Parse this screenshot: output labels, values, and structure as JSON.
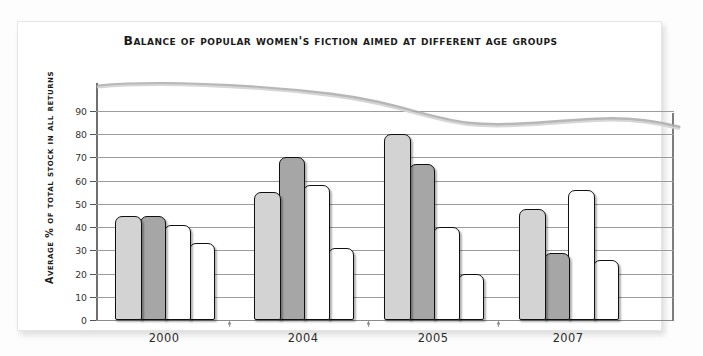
{
  "chart_data": {
    "type": "bar",
    "title": "Balance of popular women's fiction aimed at different age groups",
    "xlabel": "",
    "ylabel": "Average % of total stock in all returns",
    "ylim": [
      0,
      95
    ],
    "yticks": [
      0,
      10,
      20,
      30,
      40,
      50,
      60,
      70,
      80,
      90
    ],
    "ytick_labels": [
      "0",
      "10",
      "20",
      "30",
      "40",
      "50",
      "60",
      "70",
      "80",
      "90"
    ],
    "grid": true,
    "legend": "none",
    "categories": [
      "2000",
      "2004",
      "2005",
      "2007"
    ],
    "series": [
      {
        "name": "series-1",
        "color": "#d3d3d3",
        "values": [
          45,
          55,
          80,
          48
        ]
      },
      {
        "name": "series-2",
        "color": "#a6a6a6",
        "values": [
          45,
          70,
          67,
          29
        ]
      },
      {
        "name": "series-3",
        "color": "#ffffff",
        "values": [
          41,
          58,
          40,
          56
        ]
      },
      {
        "name": "series-4",
        "color": "#ffffff",
        "values": [
          33,
          31,
          20,
          26
        ]
      }
    ],
    "bars": [
      {
        "group": "2000",
        "series": "series-1",
        "value": 45,
        "fill": "light"
      },
      {
        "group": "2000",
        "series": "series-2",
        "value": 45,
        "fill": "medium"
      },
      {
        "group": "2000",
        "series": "series-3",
        "value": 41,
        "fill": "white"
      },
      {
        "group": "2000",
        "series": "series-4",
        "value": 33,
        "fill": "white"
      },
      {
        "group": "2004",
        "series": "series-1",
        "value": 55,
        "fill": "light"
      },
      {
        "group": "2004",
        "series": "series-2",
        "value": 70,
        "fill": "medium"
      },
      {
        "group": "2004",
        "series": "series-3",
        "value": 58,
        "fill": "white"
      },
      {
        "group": "2004",
        "series": "series-4",
        "value": 31,
        "fill": "white"
      },
      {
        "group": "2005",
        "series": "series-1",
        "value": 80,
        "fill": "light"
      },
      {
        "group": "2005",
        "series": "series-2",
        "value": 67,
        "fill": "medium"
      },
      {
        "group": "2005",
        "series": "series-3",
        "value": 40,
        "fill": "white"
      },
      {
        "group": "2005",
        "series": "series-4",
        "value": 20,
        "fill": "white"
      },
      {
        "group": "2007",
        "series": "series-1",
        "value": 48,
        "fill": "light"
      },
      {
        "group": "2007",
        "series": "series-2",
        "value": 29,
        "fill": "medium"
      },
      {
        "group": "2007",
        "series": "series-3",
        "value": 56,
        "fill": "white"
      },
      {
        "group": "2007",
        "series": "series-4",
        "value": 26,
        "fill": "white"
      }
    ],
    "colors": {
      "bar_light": "#d3d3d3",
      "bar_medium": "#a6a6a6",
      "bar_white": "#ffffff",
      "bar_outline": "#101010",
      "gridline": "#9c9c9c",
      "axis": "#6f6f6f",
      "text": "#1b1b1b",
      "card_background": "#ffffff",
      "page_background": "#fdfdfd"
    },
    "annotations": [
      {
        "name": "page-curl-curve",
        "description": "light grey scanned page-curl arc across top of plot"
      }
    ]
  }
}
